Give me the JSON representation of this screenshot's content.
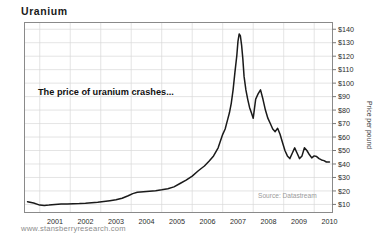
{
  "figure": {
    "title": "Uranium",
    "footer_url": "www.stansberryresearch.com",
    "background_color": "#ffffff"
  },
  "chart_data": {
    "type": "line",
    "title": "Uranium",
    "xlabel": "",
    "ylabel": "Price per pound",
    "annotation": "The price of uranium crashes...",
    "source": "Source: Datastream",
    "grid": true,
    "legend": null,
    "line_color": "#1a1a1a",
    "axis_color": "#7a7a7a",
    "grid_color": "#d8d8d8",
    "xlim": [
      2000.5,
      2010.6
    ],
    "ylim": [
      4,
      145
    ],
    "ytick_values": [
      10,
      20,
      30,
      40,
      50,
      60,
      70,
      80,
      90,
      100,
      110,
      120,
      130,
      140
    ],
    "ytick_labels": [
      "$10",
      "$20",
      "$30",
      "$40",
      "$50",
      "$60",
      "$70",
      "$80",
      "$90",
      "$100",
      "$110",
      "$120",
      "$130",
      "$140"
    ],
    "xtick_labels": [
      "2001",
      "2002",
      "2003",
      "2004",
      "2005",
      "2006",
      "2007",
      "2008",
      "2009",
      "2010"
    ],
    "xtick_values": [
      2001,
      2002,
      2003,
      2004,
      2005,
      2006,
      2007,
      2008,
      2009,
      2010
    ],
    "x": [
      2000.6,
      2000.8,
      2001.0,
      2001.15,
      2001.3,
      2001.5,
      2001.7,
      2001.9,
      2002.1,
      2002.3,
      2002.5,
      2002.7,
      2002.9,
      2003.1,
      2003.3,
      2003.5,
      2003.7,
      2003.9,
      2004.05,
      2004.2,
      2004.4,
      2004.6,
      2004.8,
      2005.0,
      2005.2,
      2005.4,
      2005.6,
      2005.8,
      2006.0,
      2006.2,
      2006.4,
      2006.55,
      2006.7,
      2006.85,
      2007.0,
      2007.08,
      2007.15,
      2007.22,
      2007.28,
      2007.34,
      2007.4,
      2007.46,
      2007.5,
      2007.54,
      2007.58,
      2007.62,
      2007.66,
      2007.7,
      2007.76,
      2007.82,
      2007.88,
      2007.94,
      2008.0,
      2008.08,
      2008.16,
      2008.24,
      2008.32,
      2008.4,
      2008.48,
      2008.56,
      2008.64,
      2008.72,
      2008.8,
      2008.88,
      2008.96,
      2009.04,
      2009.12,
      2009.2,
      2009.28,
      2009.36,
      2009.44,
      2009.52,
      2009.6,
      2009.68,
      2009.76,
      2009.84,
      2009.92,
      2010.0,
      2010.08,
      2010.16,
      2010.24,
      2010.32,
      2010.4,
      2010.5
    ],
    "y": [
      12.0,
      11.0,
      9.5,
      9.2,
      9.5,
      10.0,
      10.3,
      10.4,
      10.5,
      10.6,
      10.8,
      11.2,
      11.6,
      12.2,
      12.8,
      13.4,
      14.6,
      16.4,
      18.0,
      19.0,
      19.4,
      19.8,
      20.2,
      20.8,
      21.6,
      23.0,
      25.5,
      28.0,
      31.0,
      35.0,
      38.5,
      42.0,
      46.0,
      52.0,
      62.0,
      66.0,
      72.0,
      78.0,
      85.0,
      95.0,
      108.0,
      120.0,
      131.0,
      136.5,
      135.0,
      128.0,
      118.0,
      105.0,
      95.0,
      88.0,
      82.0,
      78.0,
      74.0,
      88.0,
      92.0,
      95.0,
      88.0,
      80.0,
      74.0,
      70.0,
      66.0,
      64.0,
      66.5,
      62.0,
      56.0,
      50.0,
      46.0,
      44.0,
      48.0,
      52.0,
      48.0,
      44.0,
      46.0,
      52.0,
      50.0,
      47.0,
      44.5,
      46.0,
      45.5,
      44.0,
      43.0,
      42.5,
      41.5,
      41.5
    ]
  }
}
